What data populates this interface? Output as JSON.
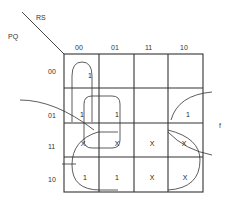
{
  "kmap": {
    "row_var": "PQ",
    "col_var": "RS",
    "output_label": "f",
    "columns": [
      "00",
      "01",
      "11",
      "10"
    ],
    "rows": [
      "00",
      "01",
      "11",
      "10"
    ],
    "cells": [
      [
        "1",
        "",
        "",
        ""
      ],
      [
        "1",
        "1",
        "",
        "1"
      ],
      [
        "X",
        "X",
        "X",
        "X"
      ],
      [
        "1",
        "1",
        "X",
        "X"
      ]
    ]
  }
}
